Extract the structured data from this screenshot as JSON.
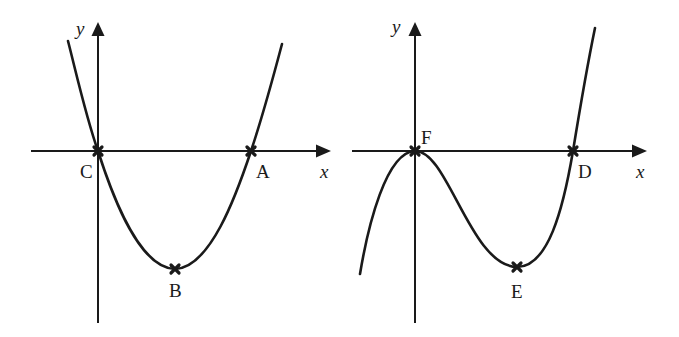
{
  "figure": {
    "background": "#ffffff",
    "ink_color": "#1a1a1a",
    "graphs": [
      {
        "id": "left",
        "curve_type": "quadratic (parabola, opens upward)",
        "axes": {
          "x_label": "x",
          "y_label": "y"
        },
        "points": [
          {
            "name": "C",
            "label": "C",
            "description": "origin / root"
          },
          {
            "name": "A",
            "label": "A",
            "description": "positive x-intercept"
          },
          {
            "name": "B",
            "label": "B",
            "description": "minimum turning point"
          }
        ]
      },
      {
        "id": "right",
        "curve_type": "cubic (positive leading coefficient)",
        "axes": {
          "x_label": "x",
          "y_label": "y"
        },
        "points": [
          {
            "name": "F",
            "label": "F",
            "description": "local maximum at origin (repeated root)"
          },
          {
            "name": "D",
            "label": "D",
            "description": "positive x-intercept"
          },
          {
            "name": "E",
            "label": "E",
            "description": "local minimum turning point"
          }
        ]
      }
    ]
  }
}
